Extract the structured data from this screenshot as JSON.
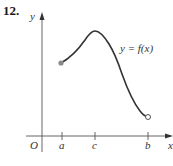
{
  "problem_number": "12.",
  "axes": {
    "x_label": "x",
    "y_label": "y",
    "origin_label": "O"
  },
  "ticks": [
    {
      "label": "a",
      "x": 62
    },
    {
      "label": "c",
      "x": 95
    },
    {
      "label": "b",
      "x": 148
    }
  ],
  "curve": {
    "label": "y = f(x)",
    "start": {
      "point": "a",
      "endpoint": "closed"
    },
    "max_at": "c",
    "end": {
      "point": "b",
      "endpoint": "open"
    }
  },
  "colors": {
    "curve": "#333333",
    "axis": "#555555",
    "closed_dot": "#8a8a8a"
  }
}
